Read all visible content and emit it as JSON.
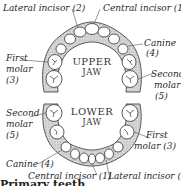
{
  "upper_jaw": {
    "title_line1": "UPPER",
    "title_line2": "JAW",
    "labels": {
      "lateral_incisor": "Lateral incisor (2)",
      "central_incisor": "Central incisor (1)",
      "canine": "Canine",
      "canine_num": "(4)",
      "first_molar": "First",
      "first_molar_2": "molar",
      "first_molar_3": "(3)",
      "second_molar": "Second",
      "second_molar_2": "molar",
      "second_molar_3": "(5)"
    }
  },
  "lower_jaw": {
    "title_line1": "LOWER",
    "title_line2": "JAW",
    "labels": {
      "second_molar": "Second",
      "second_molar_2": "molar",
      "second_molar_3": "(5)",
      "first_molar": "First",
      "first_molar_2": "molar (3)",
      "canine": "Canine (4)",
      "central_incisor": "Central incisor (1)",
      "lateral_incisor": "Lateral incisor (2)"
    }
  },
  "caption": "Primary teeth"
}
